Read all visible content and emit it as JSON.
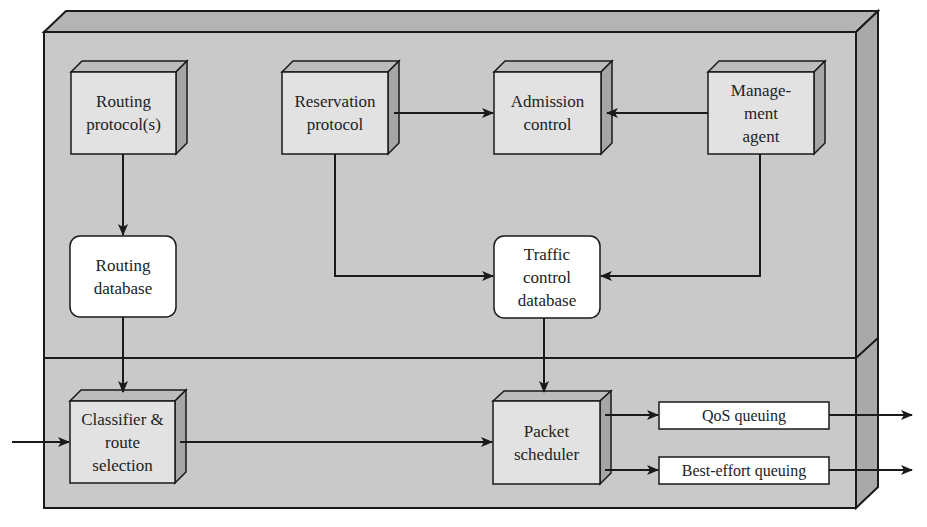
{
  "diagram": {
    "colors": {
      "panel_front": "#c9c9c9",
      "panel_side": "#a9a9a9",
      "panel_top": "#b4b4b4",
      "box_front": "#e2e2e2",
      "box_side": "#a6a6a6",
      "box_top": "#bcbcbc",
      "db_fill": "#ffffff",
      "queue_fill": "#ffffff",
      "stroke": "#1a1a1a"
    },
    "upper_layer": {
      "routing_protocols": "Routing\nprotocol(s)",
      "reservation_protocol": "Reservation\nprotocol",
      "admission_control": "Admission\ncontrol",
      "management_agent": "Manage-\nment\nagent",
      "routing_database": "Routing\ndatabase",
      "traffic_control_database": "Traffic\ncontrol\ndatabase"
    },
    "lower_layer": {
      "classifier": "Classifier &\nroute\nselection",
      "packet_scheduler": "Packet\nscheduler",
      "qos_queuing": "QoS queuing",
      "best_effort_queuing": "Best-effort queuing"
    },
    "edges": [
      {
        "from": "Routing protocol(s)",
        "to": "Routing database"
      },
      {
        "from": "Routing database",
        "to": "Classifier & route selection"
      },
      {
        "from": "Reservation protocol",
        "to": "Admission control"
      },
      {
        "from": "Management agent",
        "to": "Admission control"
      },
      {
        "from": "Reservation protocol",
        "to": "Traffic control database"
      },
      {
        "from": "Management agent",
        "to": "Traffic control database"
      },
      {
        "from": "Traffic control database",
        "to": "Packet scheduler"
      },
      {
        "from": "input",
        "to": "Classifier & route selection"
      },
      {
        "from": "Classifier & route selection",
        "to": "Packet scheduler"
      },
      {
        "from": "Packet scheduler",
        "to": "QoS queuing"
      },
      {
        "from": "Packet scheduler",
        "to": "Best-effort queuing"
      },
      {
        "from": "QoS queuing",
        "to": "output"
      },
      {
        "from": "Best-effort queuing",
        "to": "output"
      }
    ]
  }
}
